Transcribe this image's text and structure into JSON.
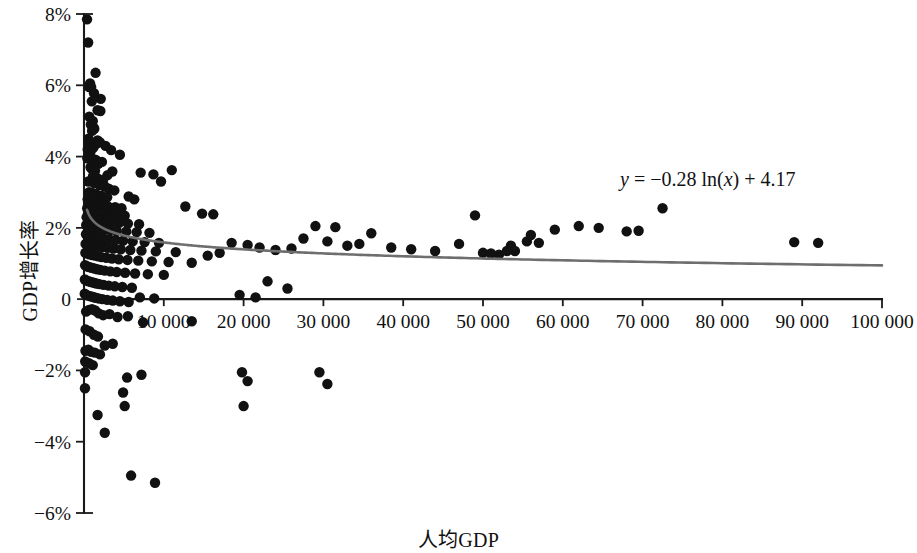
{
  "chart_data": {
    "type": "scatter",
    "title": "",
    "xlabel": "人均GDP",
    "ylabel": "GDP增长率",
    "xlim": [
      0,
      100000
    ],
    "ylim": [
      -6,
      8
    ],
    "grid": false,
    "legend": "none",
    "x_tick_labels": [
      "10 000",
      "20 000",
      "30 000",
      "40 000",
      "50 000",
      "60 000",
      "70 000",
      "80 000",
      "90 000",
      "100 000"
    ],
    "x_tick_values": [
      10000,
      20000,
      30000,
      40000,
      50000,
      60000,
      70000,
      80000,
      90000,
      100000
    ],
    "y_tick_labels": [
      "8%",
      "6%",
      "4%",
      "2%",
      "0",
      "-2%",
      "-4%",
      "-6%"
    ],
    "y_tick_values": [
      8,
      6,
      4,
      2,
      0,
      -2,
      -4,
      -6
    ],
    "annotations": [
      {
        "name": "trendline-equation",
        "text": "y = −0.28 ln(x) + 4.17",
        "x": 72000,
        "y": 3.1
      }
    ],
    "trendline": {
      "type": "logarithmic",
      "equation": "y = -0.28 ln(x) + 4.17",
      "slope": -0.28,
      "intercept": 4.17,
      "color": "#6e6e6e"
    },
    "marker": {
      "shape": "circle",
      "color": "#111111",
      "size": 5.2
    },
    "series": [
      {
        "name": "国家/地区",
        "points": [
          [
            380,
            7.85
          ],
          [
            520,
            7.2
          ],
          [
            1450,
            6.35
          ],
          [
            760,
            6.05
          ],
          [
            640,
            5.95
          ],
          [
            900,
            5.95
          ],
          [
            1250,
            5.78
          ],
          [
            2100,
            5.62
          ],
          [
            980,
            5.55
          ],
          [
            1700,
            5.3
          ],
          [
            2050,
            5.28
          ],
          [
            660,
            5.12
          ],
          [
            1100,
            5.0
          ],
          [
            860,
            4.9
          ],
          [
            1180,
            4.82
          ],
          [
            1290,
            4.78
          ],
          [
            1010,
            4.72
          ],
          [
            560,
            4.5
          ],
          [
            590,
            4.42
          ],
          [
            1700,
            4.45
          ],
          [
            2000,
            4.4
          ],
          [
            1500,
            4.35
          ],
          [
            2700,
            4.3
          ],
          [
            640,
            4.3
          ],
          [
            1170,
            4.25
          ],
          [
            470,
            4.2
          ],
          [
            830,
            4.15
          ],
          [
            3400,
            4.18
          ],
          [
            4500,
            4.05
          ],
          [
            700,
            4.0
          ],
          [
            420,
            3.95
          ],
          [
            1320,
            3.92
          ],
          [
            1520,
            3.9
          ],
          [
            2250,
            3.85
          ],
          [
            1800,
            3.8
          ],
          [
            820,
            3.7
          ],
          [
            960,
            3.66
          ],
          [
            1380,
            3.6
          ],
          [
            3550,
            3.58
          ],
          [
            2950,
            3.48
          ],
          [
            1130,
            3.45
          ],
          [
            1620,
            3.4
          ],
          [
            2400,
            3.35
          ],
          [
            7100,
            3.55
          ],
          [
            8700,
            3.5
          ],
          [
            11000,
            3.62
          ],
          [
            9650,
            3.3
          ],
          [
            540,
            3.3
          ],
          [
            1260,
            3.26
          ],
          [
            1950,
            3.2
          ],
          [
            2600,
            3.16
          ],
          [
            3100,
            3.1
          ],
          [
            3800,
            3.05
          ],
          [
            650,
            3.0
          ],
          [
            1050,
            2.98
          ],
          [
            1480,
            2.95
          ],
          [
            2150,
            2.9
          ],
          [
            2900,
            2.86
          ],
          [
            5600,
            2.88
          ],
          [
            6300,
            2.8
          ],
          [
            460,
            2.8
          ],
          [
            880,
            2.76
          ],
          [
            1350,
            2.72
          ],
          [
            1900,
            2.68
          ],
          [
            2350,
            2.64
          ],
          [
            3000,
            2.6
          ],
          [
            3900,
            2.58
          ],
          [
            4700,
            2.55
          ],
          [
            12700,
            2.6
          ],
          [
            400,
            2.55
          ],
          [
            750,
            2.5
          ],
          [
            1160,
            2.48
          ],
          [
            1550,
            2.45
          ],
          [
            2080,
            2.42
          ],
          [
            2550,
            2.4
          ],
          [
            3250,
            2.38
          ],
          [
            4200,
            2.35
          ],
          [
            5100,
            2.34
          ],
          [
            14800,
            2.4
          ],
          [
            16200,
            2.38
          ],
          [
            330,
            2.3
          ],
          [
            620,
            2.28
          ],
          [
            980,
            2.26
          ],
          [
            1420,
            2.24
          ],
          [
            1830,
            2.22
          ],
          [
            2280,
            2.2
          ],
          [
            2750,
            2.18
          ],
          [
            3450,
            2.16
          ],
          [
            4400,
            2.14
          ],
          [
            5500,
            2.12
          ],
          [
            6900,
            2.1
          ],
          [
            280,
            2.08
          ],
          [
            540,
            2.06
          ],
          [
            870,
            2.04
          ],
          [
            1280,
            2.02
          ],
          [
            1690,
            2.0
          ],
          [
            2120,
            1.98
          ],
          [
            2620,
            1.96
          ],
          [
            3300,
            1.94
          ],
          [
            4100,
            1.92
          ],
          [
            5300,
            1.9
          ],
          [
            6600,
            1.88
          ],
          [
            8200,
            1.86
          ],
          [
            29000,
            2.05
          ],
          [
            31500,
            2.02
          ],
          [
            36000,
            1.85
          ],
          [
            250,
            1.82
          ],
          [
            490,
            1.8
          ],
          [
            800,
            1.78
          ],
          [
            1210,
            1.76
          ],
          [
            1600,
            1.74
          ],
          [
            2000,
            1.72
          ],
          [
            2480,
            1.7
          ],
          [
            3150,
            1.68
          ],
          [
            3950,
            1.66
          ],
          [
            4900,
            1.64
          ],
          [
            6100,
            1.62
          ],
          [
            7600,
            1.6
          ],
          [
            9400,
            1.58
          ],
          [
            200,
            1.55
          ],
          [
            440,
            1.53
          ],
          [
            720,
            1.52
          ],
          [
            1120,
            1.5
          ],
          [
            1500,
            1.49
          ],
          [
            1880,
            1.47
          ],
          [
            2330,
            1.46
          ],
          [
            2950,
            1.44
          ],
          [
            3700,
            1.42
          ],
          [
            4600,
            1.4
          ],
          [
            5800,
            1.38
          ],
          [
            7200,
            1.36
          ],
          [
            9000,
            1.34
          ],
          [
            11500,
            1.32
          ],
          [
            170,
            1.3
          ],
          [
            400,
            1.28
          ],
          [
            670,
            1.26
          ],
          [
            1030,
            1.24
          ],
          [
            1390,
            1.22
          ],
          [
            1760,
            1.2
          ],
          [
            2200,
            1.18
          ],
          [
            2800,
            1.16
          ],
          [
            3500,
            1.14
          ],
          [
            4350,
            1.12
          ],
          [
            5450,
            1.1
          ],
          [
            6800,
            1.08
          ],
          [
            8500,
            1.06
          ],
          [
            10600,
            1.04
          ],
          [
            13500,
            1.02
          ],
          [
            140,
            0.95
          ],
          [
            360,
            0.92
          ],
          [
            620,
            0.9
          ],
          [
            950,
            0.88
          ],
          [
            1300,
            0.86
          ],
          [
            1650,
            0.84
          ],
          [
            2060,
            0.82
          ],
          [
            2600,
            0.8
          ],
          [
            3300,
            0.78
          ],
          [
            4100,
            0.76
          ],
          [
            5150,
            0.74
          ],
          [
            6400,
            0.72
          ],
          [
            8000,
            0.7
          ],
          [
            10000,
            0.68
          ],
          [
            110,
            0.55
          ],
          [
            320,
            0.52
          ],
          [
            570,
            0.5
          ],
          [
            880,
            0.48
          ],
          [
            1220,
            0.46
          ],
          [
            1550,
            0.44
          ],
          [
            1940,
            0.42
          ],
          [
            2450,
            0.4
          ],
          [
            3100,
            0.38
          ],
          [
            3850,
            0.36
          ],
          [
            4800,
            0.34
          ],
          [
            6000,
            0.32
          ],
          [
            90,
            0.15
          ],
          [
            290,
            0.12
          ],
          [
            520,
            0.1
          ],
          [
            810,
            0.08
          ],
          [
            1140,
            0.06
          ],
          [
            1450,
            0.04
          ],
          [
            1820,
            0.02
          ],
          [
            2300,
            0.0
          ],
          [
            2900,
            -0.02
          ],
          [
            3600,
            -0.04
          ],
          [
            4500,
            -0.06
          ],
          [
            5600,
            -0.08
          ],
          [
            7000,
            0.05
          ],
          [
            8800,
            0.02
          ],
          [
            19500,
            0.12
          ],
          [
            21500,
            0.05
          ],
          [
            23000,
            0.5
          ],
          [
            25500,
            0.3
          ],
          [
            44000,
            1.35
          ],
          [
            47000,
            1.55
          ],
          [
            50000,
            1.3
          ],
          [
            52000,
            1.25
          ],
          [
            53500,
            1.5
          ],
          [
            54000,
            1.35
          ],
          [
            55500,
            1.62
          ],
          [
            57000,
            1.58
          ],
          [
            49000,
            2.35
          ],
          [
            51000,
            1.28
          ],
          [
            53000,
            1.35
          ],
          [
            56000,
            1.8
          ],
          [
            59000,
            1.95
          ],
          [
            62000,
            2.05
          ],
          [
            64500,
            2.0
          ],
          [
            68000,
            1.9
          ],
          [
            69500,
            1.92
          ],
          [
            72500,
            2.55
          ],
          [
            89000,
            1.6
          ],
          [
            92000,
            1.58
          ],
          [
            41000,
            1.4
          ],
          [
            38500,
            1.45
          ],
          [
            34500,
            1.55
          ],
          [
            33000,
            1.5
          ],
          [
            30500,
            1.62
          ],
          [
            27500,
            1.7
          ],
          [
            26000,
            1.42
          ],
          [
            24000,
            1.38
          ],
          [
            22000,
            1.45
          ],
          [
            20500,
            1.52
          ],
          [
            18500,
            1.58
          ],
          [
            17000,
            1.3
          ],
          [
            15500,
            1.22
          ],
          [
            260,
            -0.35
          ],
          [
            620,
            -0.3
          ],
          [
            1000,
            -0.28
          ],
          [
            1400,
            -0.32
          ],
          [
            1850,
            -0.4
          ],
          [
            2400,
            -0.45
          ],
          [
            3200,
            -0.42
          ],
          [
            4200,
            -0.5
          ],
          [
            5500,
            -0.48
          ],
          [
            7400,
            -0.65
          ],
          [
            13500,
            -0.62
          ],
          [
            200,
            -0.85
          ],
          [
            700,
            -0.9
          ],
          [
            1250,
            -1.0
          ],
          [
            1750,
            -1.05
          ],
          [
            2600,
            -1.3
          ],
          [
            3600,
            -1.25
          ],
          [
            180,
            -1.45
          ],
          [
            550,
            -1.42
          ],
          [
            900,
            -1.48
          ],
          [
            1350,
            -1.5
          ],
          [
            2000,
            -1.55
          ],
          [
            150,
            -1.75
          ],
          [
            620,
            -1.8
          ],
          [
            1100,
            -1.85
          ],
          [
            130,
            -2.05
          ],
          [
            5400,
            -2.2
          ],
          [
            7200,
            -2.12
          ],
          [
            19800,
            -2.05
          ],
          [
            20500,
            -2.3
          ],
          [
            29500,
            -2.05
          ],
          [
            30500,
            -2.38
          ],
          [
            120,
            -2.5
          ],
          [
            4900,
            -2.62
          ],
          [
            5100,
            -3.0
          ],
          [
            1700,
            -3.25
          ],
          [
            20000,
            -3.0
          ],
          [
            2600,
            -3.75
          ],
          [
            5900,
            -4.95
          ],
          [
            8900,
            -5.15
          ]
        ]
      }
    ]
  },
  "axes": {
    "y_axis_title": "GDP增长率",
    "x_axis_title": "人均GDP"
  },
  "equation": {
    "lhs": "y",
    "eq": " = ",
    "rhs_a": "−0.28 ln(",
    "rhs_x": "x",
    "rhs_b": ") + 4.17"
  }
}
